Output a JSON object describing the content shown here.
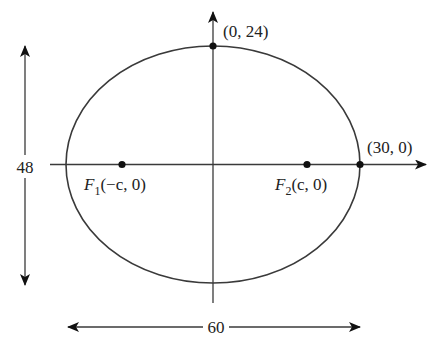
{
  "diagram": {
    "type": "ellipse-with-foci",
    "colors": {
      "stroke": "#3a3a3a",
      "fill": "#ffffff",
      "text": "#222222",
      "point": "#111111"
    },
    "axes": {
      "x_arrow": true,
      "y_arrow": true
    },
    "ellipse": {
      "center": [
        0,
        0
      ],
      "semi_major": 30,
      "semi_minor": 24,
      "equation_implied": "x^2/30^2 + y^2/24^2 = 1"
    },
    "points": [
      {
        "id": "top_vertex",
        "label": "(0, 24)",
        "x": 0,
        "y": 24
      },
      {
        "id": "right_vertex",
        "label": "(30, 0)",
        "x": 30,
        "y": 0
      },
      {
        "id": "focus1",
        "label_main": "F",
        "label_sub": "1",
        "label_rest": "(−c, 0)",
        "x": "-c",
        "y": 0
      },
      {
        "id": "focus2",
        "label_main": "F",
        "label_sub": "2",
        "label_rest": "(c, 0)",
        "x": "c",
        "y": 0
      }
    ],
    "dimensions": {
      "height_label": "48",
      "width_label": "60"
    }
  }
}
